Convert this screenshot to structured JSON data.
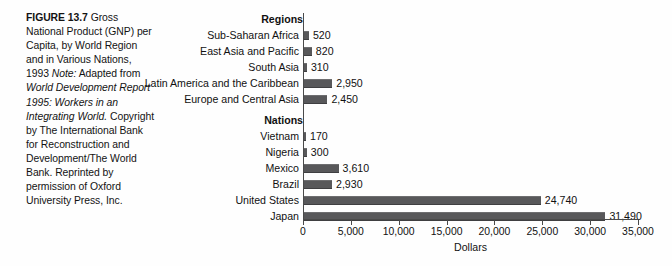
{
  "figure": {
    "label": "FIGURE 13.7",
    "title": "Gross National Product (GNP) per Capita, by World Region and in Various Nations, 1993",
    "note_label": "Note:",
    "note_lead": "Adapted from",
    "note_source_italic": "World Development Report 1995: Workers in an Integrating World.",
    "note_rest": "Copyright by The International Bank for Reconstruction and Development/The World Bank. Reprinted by permission of Oxford University Press, Inc."
  },
  "chart_data": {
    "type": "bar",
    "orientation": "horizontal",
    "title": "",
    "xlabel": "Dollars",
    "ylabel": "",
    "xlim": [
      0,
      35000
    ],
    "xticks": [
      0,
      5000,
      10000,
      15000,
      20000,
      25000,
      30000,
      35000
    ],
    "xticklabels": [
      "0",
      "5,000",
      "10,000",
      "15,000",
      "20,000",
      "25,000",
      "30,000",
      "35,000"
    ],
    "grid": false,
    "legend": false,
    "bar_color": "#58585a",
    "groups": [
      {
        "header": "Regions",
        "items": [
          {
            "category": "Sub-Saharan Africa",
            "value": 520,
            "label": "520"
          },
          {
            "category": "East Asia and Pacific",
            "value": 820,
            "label": "820"
          },
          {
            "category": "South Asia",
            "value": 310,
            "label": "310"
          },
          {
            "category": "Latin America and the Caribbean",
            "value": 2950,
            "label": "2,950"
          },
          {
            "category": "Europe and Central Asia",
            "value": 2450,
            "label": "2,450"
          }
        ]
      },
      {
        "header": "Nations",
        "items": [
          {
            "category": "Vietnam",
            "value": 170,
            "label": "170"
          },
          {
            "category": "Nigeria",
            "value": 300,
            "label": "300"
          },
          {
            "category": "Mexico",
            "value": 3610,
            "label": "3,610"
          },
          {
            "category": "Brazil",
            "value": 2930,
            "label": "2,930"
          },
          {
            "category": "United States",
            "value": 24740,
            "label": "24,740"
          },
          {
            "category": "Japan",
            "value": 31490,
            "label": "31,490"
          }
        ]
      }
    ]
  }
}
